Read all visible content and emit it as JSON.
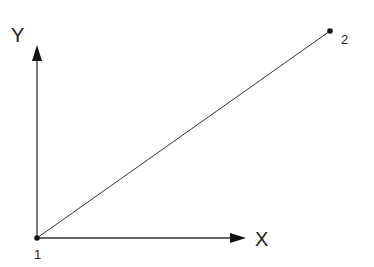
{
  "diagram": {
    "type": "coordinate-axes-with-line",
    "axes": {
      "x_label": "X",
      "y_label": "Y"
    },
    "points": [
      {
        "id": "point-1",
        "label": "1",
        "role": "origin"
      },
      {
        "id": "point-2",
        "label": "2",
        "role": "endpoint"
      }
    ],
    "segment": {
      "from": "1",
      "to": "2"
    },
    "colors": {
      "ink": "#111111",
      "line": "#333333",
      "background": "#ffffff"
    }
  }
}
